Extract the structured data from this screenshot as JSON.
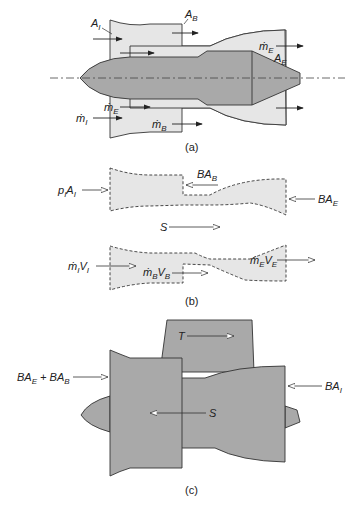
{
  "panels": [
    {
      "id": "a",
      "caption": "(a)",
      "labels": {
        "A_I": {
          "main": "A",
          "sub": "I"
        },
        "A_B": {
          "main": "A",
          "sub": "B"
        },
        "A_E": {
          "main": "A",
          "sub": "E"
        },
        "mdot_E_top": {
          "main": "ṁ",
          "sub": "E"
        },
        "mdot_E_bottom": {
          "main": "ṁ",
          "sub": "E"
        },
        "mdot_I": {
          "main": "ṁ",
          "sub": "I"
        },
        "mdot_B": {
          "main": "ṁ",
          "sub": "B"
        }
      }
    },
    {
      "id": "b",
      "caption": "(b)",
      "labels": {
        "pI_AI": {
          "main1": "p",
          "sub1": "I",
          "main2": "A",
          "sub2": "I"
        },
        "BA_B": {
          "main": "BA",
          "sub": "B"
        },
        "BA_E": {
          "main": "BA",
          "sub": "E"
        },
        "S": "S",
        "mI_VI": {
          "main1": "ṁ",
          "sub1": "I",
          "main2": "V",
          "sub2": "I"
        },
        "mB_VB": {
          "main1": "ṁ",
          "sub1": "B",
          "main2": "V",
          "sub2": "B"
        },
        "mE_VE": {
          "main1": "ṁ",
          "sub1": "E",
          "main2": "V",
          "sub2": "E"
        }
      }
    },
    {
      "id": "c",
      "caption": "(c)",
      "labels": {
        "BA_E_plus_BA_B": {
          "main1": "BA",
          "sub1": "E",
          "plus": " + ",
          "main2": "BA",
          "sub2": "B"
        },
        "T": "T",
        "BA_I": {
          "main": "BA",
          "sub": "I"
        },
        "S": "S"
      }
    }
  ],
  "colors": {
    "light_fill": "#e6e6e6",
    "dark_fill": "#a9a9a9",
    "stroke": "#333333"
  }
}
